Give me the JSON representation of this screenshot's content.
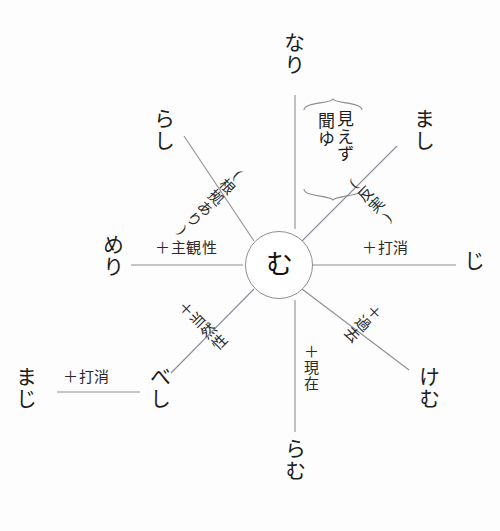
{
  "diagram": {
    "center": {
      "label": "む",
      "name": "center-node-mu"
    },
    "stroke_color": "#8d8d96",
    "text_color": "#1d1d1d",
    "background_color": "#fdfdfd",
    "nodes": [
      {
        "id": "nari",
        "label": "なり",
        "position": "top"
      },
      {
        "id": "mashi",
        "label": "まし",
        "position": "top-right"
      },
      {
        "id": "ji",
        "label": "じ",
        "position": "right"
      },
      {
        "id": "kemu",
        "label": "けむ",
        "position": "bottom-right"
      },
      {
        "id": "ramu",
        "label": "らむ",
        "position": "bottom"
      },
      {
        "id": "beshi",
        "label": "べし",
        "position": "bottom-left"
      },
      {
        "id": "meri",
        "label": "めり",
        "position": "left"
      },
      {
        "id": "rashi",
        "label": "らし",
        "position": "top-left"
      },
      {
        "id": "maji",
        "label": "まじ",
        "position": "far-bottom-left"
      }
    ],
    "edge_labels": [
      {
        "id": "edge-top-right",
        "label": "(反実)",
        "orientation": "rotated-up-right"
      },
      {
        "id": "edge-right",
        "label": "＋打消",
        "orientation": "horizontal"
      },
      {
        "id": "edge-bottom-right",
        "label": "＋過去",
        "orientation": "rotated-down-right"
      },
      {
        "id": "edge-bottom",
        "label": "＋現在",
        "orientation": "vertical"
      },
      {
        "id": "edge-bottom-left",
        "label": "＋当然性",
        "orientation": "rotated-down-left"
      },
      {
        "id": "edge-left",
        "label": "＋主観性",
        "orientation": "horizontal"
      },
      {
        "id": "edge-top-left",
        "label": "(根拠あり)",
        "orientation": "rotated-up-left"
      },
      {
        "id": "edge-maji",
        "label": "＋打消",
        "orientation": "horizontal"
      }
    ],
    "brace_group": {
      "id": "nari-sense-brace",
      "words": [
        "聞ゆ",
        "見えず"
      ]
    }
  }
}
